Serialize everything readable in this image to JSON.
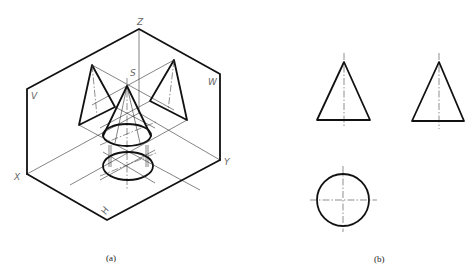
{
  "figure": {
    "a": {
      "caption": "(a)",
      "labels": {
        "z": "Z",
        "x": "X",
        "y": "Y",
        "v": "V",
        "w": "W",
        "h": "H",
        "s": "S"
      }
    },
    "b": {
      "caption": "(b)"
    }
  },
  "colors": {
    "line": "#111111",
    "label": "#666666",
    "background": "#ffffff"
  }
}
